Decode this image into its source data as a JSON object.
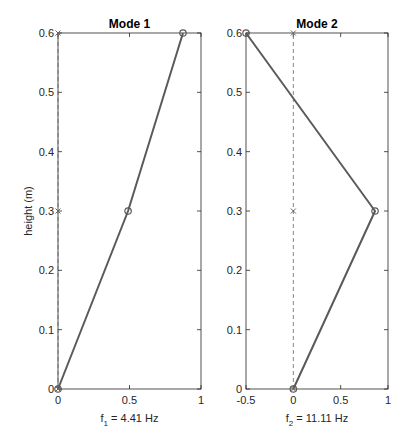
{
  "chart_data": [
    {
      "type": "line",
      "title": "Mode 1",
      "xlabel": "f_1 = 4.41 Hz",
      "xlabel_main": "f",
      "xlabel_sub": "1",
      "xlabel_rest": " = 4.41 Hz",
      "ylabel": "height (m)",
      "xlim": [
        0,
        1
      ],
      "ylim": [
        0,
        0.6
      ],
      "xticks": [
        "0",
        "0.5",
        "1"
      ],
      "xtick_values": [
        0,
        0.5,
        1
      ],
      "yticks": [
        "0",
        "0.1",
        "0.2",
        "0.3",
        "0.4",
        "0.5",
        "0.6"
      ],
      "ytick_values": [
        0,
        0.1,
        0.2,
        0.3,
        0.4,
        0.5,
        0.6
      ],
      "grid": false,
      "series": [
        {
          "name": "mode shape",
          "style": "solid",
          "marker": "o",
          "x": [
            0,
            0.49,
            0.874
          ],
          "y": [
            0,
            0.3,
            0.6
          ]
        },
        {
          "name": "undeformed",
          "style": "dashed",
          "marker": "x",
          "x": [
            0,
            0,
            0
          ],
          "y": [
            0,
            0.3,
            0.6
          ]
        }
      ]
    },
    {
      "type": "line",
      "title": "Mode 2",
      "xlabel": "f_2 = 11.11 Hz",
      "xlabel_main": "f",
      "xlabel_sub": "2",
      "xlabel_rest": " = 11.11 Hz",
      "ylabel": "",
      "xlim": [
        -0.5,
        1
      ],
      "ylim": [
        0,
        0.6
      ],
      "xticks": [
        "-0.5",
        "0",
        "0.5",
        "1"
      ],
      "xtick_values": [
        -0.5,
        0,
        0.5,
        1
      ],
      "yticks": [
        "0",
        "0.1",
        "0.2",
        "0.3",
        "0.4",
        "0.5",
        "0.6"
      ],
      "ytick_values": [
        0,
        0.1,
        0.2,
        0.3,
        0.4,
        0.5,
        0.6
      ],
      "grid": false,
      "series": [
        {
          "name": "mode shape",
          "style": "solid",
          "marker": "o",
          "x": [
            0,
            0.863,
            -0.5
          ],
          "y": [
            0,
            0.3,
            0.6
          ]
        },
        {
          "name": "undeformed",
          "style": "dashed",
          "marker": "x",
          "x": [
            0,
            0,
            0
          ],
          "y": [
            0,
            0.3,
            0.6
          ]
        }
      ]
    }
  ],
  "colors": {
    "line": "#5a5a5a",
    "axis": "#262626",
    "dashed": "#666666"
  },
  "layout": {
    "axes": [
      {
        "left": 58,
        "right": 201,
        "top": 33,
        "bottom": 389
      },
      {
        "left": 246,
        "right": 388,
        "top": 33,
        "bottom": 389
      }
    ]
  }
}
